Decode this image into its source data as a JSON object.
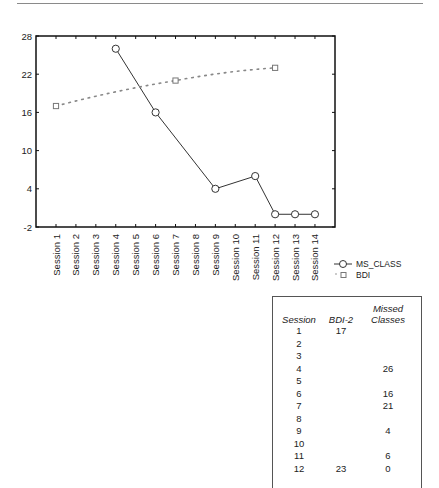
{
  "chart_data": {
    "type": "line",
    "title": "",
    "xlabel": "",
    "ylabel": "",
    "ylim": [
      -2,
      28
    ],
    "yticks": [
      -2,
      4,
      10,
      16,
      22,
      28
    ],
    "grid": false,
    "legend_position": "right-bottom",
    "categories": [
      "Session 1",
      "Session 2",
      "Session 3",
      "Session 4",
      "Session 5",
      "Session 6",
      "Session 7",
      "Session 8",
      "Session 9",
      "Session 10",
      "Session 11",
      "Session 12",
      "Session 13",
      "Session 14"
    ],
    "series": [
      {
        "name": "MS_CLASS",
        "style": "solid-circle",
        "values": [
          null,
          null,
          null,
          26,
          null,
          16,
          null,
          null,
          4,
          null,
          6,
          0,
          0,
          0
        ]
      },
      {
        "name": "BDI",
        "style": "dotted-square",
        "values": [
          17,
          null,
          null,
          null,
          null,
          null,
          21,
          null,
          null,
          null,
          null,
          23,
          null,
          null
        ]
      }
    ]
  },
  "legend": {
    "items": [
      {
        "label": "MS_CLASS"
      },
      {
        "label": "BDI"
      }
    ]
  },
  "table": {
    "headers": {
      "session": "Session",
      "bdi": "BDI-2",
      "missed_line1": "Missed",
      "missed_line2": "Classes"
    },
    "rows": [
      {
        "session": "1",
        "bdi": "17",
        "missed": ""
      },
      {
        "session": "2",
        "bdi": "",
        "missed": ""
      },
      {
        "session": "3",
        "bdi": "",
        "missed": ""
      },
      {
        "session": "4",
        "bdi": "",
        "missed": "26"
      },
      {
        "session": "5",
        "bdi": "",
        "missed": ""
      },
      {
        "session": "6",
        "bdi": "",
        "missed": "16"
      },
      {
        "session": "7",
        "bdi": "",
        "missed": "21"
      },
      {
        "session": "8",
        "bdi": "",
        "missed": ""
      },
      {
        "session": "9",
        "bdi": "",
        "missed": "4"
      },
      {
        "session": "10",
        "bdi": "",
        "missed": ""
      },
      {
        "session": "11",
        "bdi": "",
        "missed": "6"
      },
      {
        "session": "12",
        "bdi": "23",
        "missed": "0"
      }
    ]
  }
}
